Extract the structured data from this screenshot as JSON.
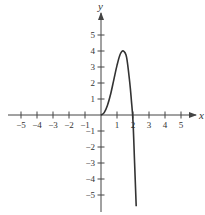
{
  "chart_data": {
    "type": "line",
    "title": "",
    "xlabel": "x",
    "ylabel": "y",
    "xlim": [
      -5.8,
      5.8
    ],
    "ylim": [
      -5.9,
      6.2
    ],
    "grid": false,
    "x_ticks": [
      -5,
      -4,
      -3,
      -2,
      -1,
      1,
      2,
      3,
      4,
      5
    ],
    "x_tick_labels": [
      "−5",
      "−4",
      "−3",
      "−2",
      "−1",
      "1",
      "2",
      "3",
      "4",
      "5"
    ],
    "y_ticks": [
      5,
      4,
      3,
      2,
      1,
      -1,
      -2,
      -3,
      -4,
      -5
    ],
    "y_tick_labels": [
      "5",
      "4",
      "3",
      "2",
      "1",
      "−1",
      "−2",
      "−3",
      "−4",
      "−5"
    ],
    "series": [
      {
        "name": "f(x)",
        "x": [
          0,
          0.2,
          0.4,
          0.6,
          0.8,
          1.0,
          1.2,
          1.4,
          1.6,
          1.8,
          1.9,
          2.0,
          2.1,
          2.2
        ],
        "y": [
          0,
          0.15,
          0.6,
          1.3,
          2.2,
          3.1,
          3.8,
          4.0,
          3.6,
          2.0,
          0.9,
          -0.4,
          -3.0,
          -5.7
        ]
      }
    ],
    "origin_px": [
      101,
      115
    ],
    "unit_px": 16
  }
}
